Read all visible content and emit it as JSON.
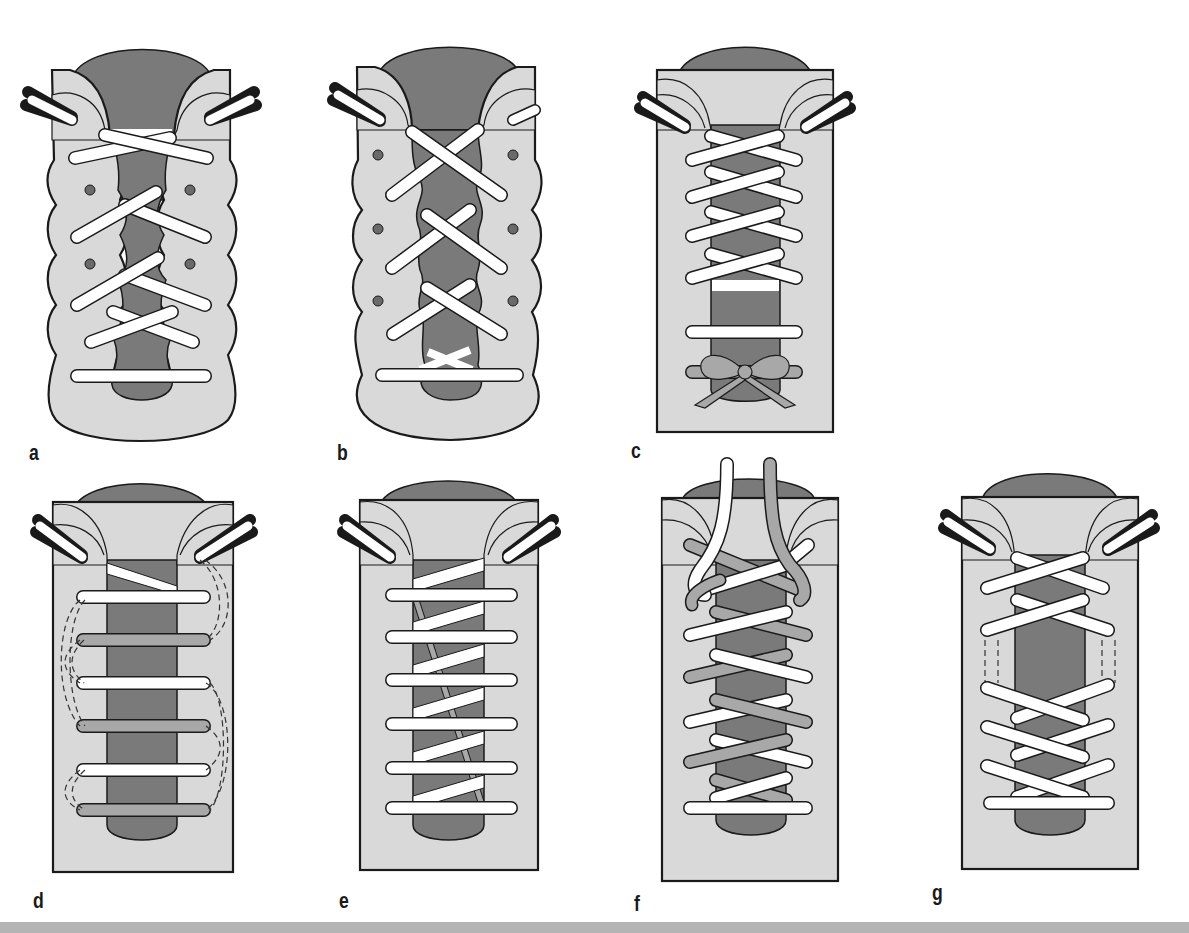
{
  "figure": {
    "colors": {
      "shoe_body": "#d9d9d9",
      "tongue": "#7a7a7a",
      "outline": "#1a1a1a",
      "lace_white": "#ffffff",
      "lace_gray": "#a8a8a8",
      "eyelet": "#6a6a6a",
      "strip": "#b4b4b4"
    },
    "panels": [
      {
        "id": "a",
        "label": "a",
        "shape": "wavy",
        "description": "Criss-cross lacing skipping eyelets, wavy-edged upper"
      },
      {
        "id": "b",
        "label": "b",
        "shape": "wavy",
        "description": "Criss-cross lacing skipping eyelets on wavy-edged upper"
      },
      {
        "id": "c",
        "label": "c",
        "shape": "straight",
        "description": "Criss-cross lacing with bow tied low"
      },
      {
        "id": "d",
        "label": "d",
        "shape": "straight",
        "description": "Straight bar lacing with hidden (dashed) crossings"
      },
      {
        "id": "e",
        "label": "e",
        "shape": "straight",
        "description": "Straight European lacing with diagonal runs"
      },
      {
        "id": "f",
        "label": "f",
        "shape": "straight",
        "description": "Two-color criss-cross lacing"
      },
      {
        "id": "g",
        "label": "g",
        "shape": "straight",
        "description": "Criss-cross lacing with skipped eyelet gap (dashed)"
      }
    ]
  }
}
